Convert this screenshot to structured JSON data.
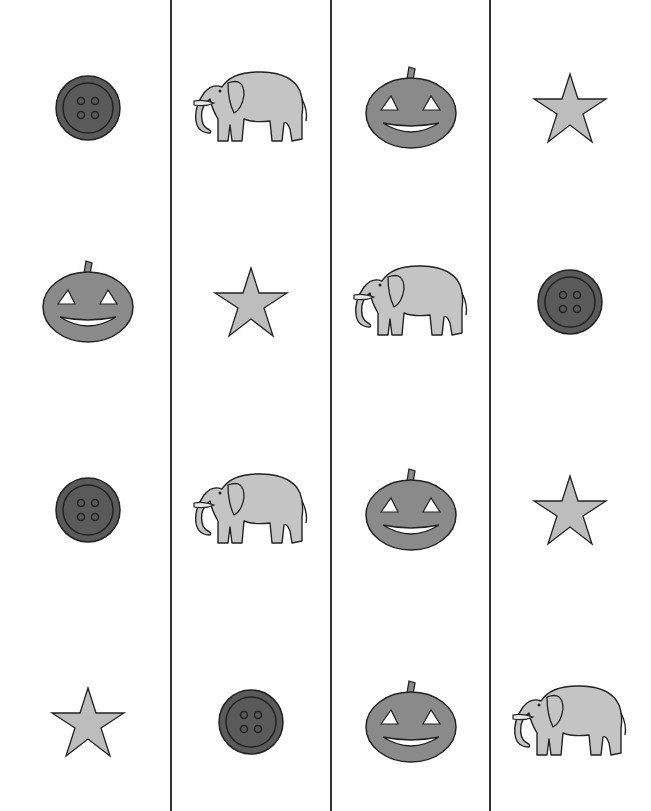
{
  "worksheet": {
    "columns": 4,
    "rows": 4,
    "divider_x": [
      171,
      331,
      490
    ],
    "colors": {
      "button": "#5a5a5a",
      "pumpkin": "#8a8a8a",
      "star": "#bdbdbd",
      "elephant": "#c4c4c4",
      "outline": "#222222",
      "line": "#333333"
    },
    "grid": [
      [
        "button",
        "elephant",
        "pumpkin",
        "star"
      ],
      [
        "pumpkin",
        "star",
        "elephant",
        "button"
      ],
      [
        "button",
        "elephant",
        "pumpkin",
        "star"
      ],
      [
        "star",
        "button",
        "pumpkin",
        "elephant"
      ]
    ]
  }
}
